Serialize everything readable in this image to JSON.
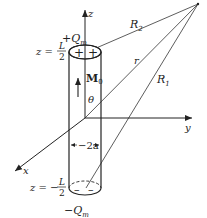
{
  "diagram": {
    "type": "physics-diagram",
    "axes": {
      "z": "z",
      "y": "y",
      "x": "x"
    },
    "charges": {
      "top": "+Q",
      "top_sub": "m",
      "bottom": "−Q",
      "bottom_sub": "m"
    },
    "positions": {
      "top_prefix": "z =",
      "top_num": "L",
      "top_den": "2",
      "bottom_prefix": "z = −",
      "bottom_num": "L",
      "bottom_den": "2"
    },
    "magnetization": {
      "symbol": "M",
      "sub": "0"
    },
    "angle": "θ",
    "diameter": "2a",
    "distances": {
      "r2": "R",
      "r2_sub": "2",
      "r": "r",
      "r1": "R",
      "r1_sub": "1"
    },
    "surface_signs": {
      "top": [
        "+",
        "+"
      ],
      "bottom": [
        "–",
        "–"
      ]
    },
    "colors": {
      "ink": "#222222",
      "background": "#ffffff"
    }
  }
}
